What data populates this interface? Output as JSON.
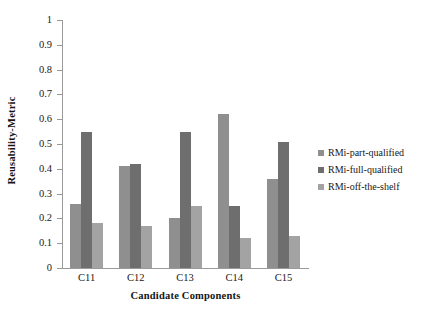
{
  "chart_data": {
    "type": "bar",
    "title": "",
    "xlabel": "Candidate Components",
    "ylabel": "Reusability-Metric",
    "categories": [
      "C11",
      "C12",
      "C13",
      "C14",
      "C15"
    ],
    "ylim": [
      0,
      1
    ],
    "yticks": [
      "0",
      "0.1",
      "0.2",
      "0.3",
      "0.4",
      "0.5",
      "0.6",
      "0.7",
      "0.8",
      "0.9",
      "1"
    ],
    "grid": false,
    "legend_position": "right",
    "series": [
      {
        "name": "RMi-part-qualified",
        "color": "#8f8f8f",
        "values": [
          0.26,
          0.41,
          0.2,
          0.62,
          0.36
        ]
      },
      {
        "name": "RMi-full-qualified",
        "color": "#6e6e6e",
        "values": [
          0.55,
          0.42,
          0.55,
          0.25,
          0.51
        ]
      },
      {
        "name": "RMi-off-the-shelf",
        "color": "#a3a3a3",
        "values": [
          0.18,
          0.17,
          0.25,
          0.12,
          0.13
        ]
      }
    ]
  },
  "legend": {
    "items": [
      {
        "label": "RMi-part-qualified"
      },
      {
        "label": "RMi-full-qualified"
      },
      {
        "label": "RMi-off-the-shelf"
      }
    ]
  }
}
